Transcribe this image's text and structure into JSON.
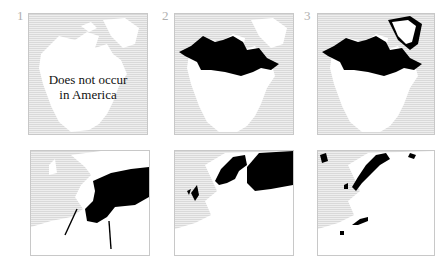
{
  "figure": {
    "panels": [
      {
        "number": "1",
        "region": "North America",
        "range_shown": "none",
        "note_line1": "Does not occur",
        "note_line2": "in America"
      },
      {
        "number": "2",
        "region": "North America",
        "range_shown": "northern Canada / Alaska"
      },
      {
        "number": "3",
        "region": "North America",
        "range_shown": "northern Canada / Alaska, Greenland coast"
      },
      {
        "number": "",
        "region": "Europe",
        "range_shown": "eastern Europe / Russia"
      },
      {
        "number": "",
        "region": "Europe",
        "range_shown": "Scandinavia, British Isles, northern Russia"
      },
      {
        "number": "",
        "region": "Europe",
        "range_shown": "Scandinavian mountains, Alps, Pyrenees, Iceland"
      }
    ],
    "colors": {
      "range": "#000000",
      "land": "#ffffff",
      "sea": "#e3e3e3",
      "frame": "#c8c8c8",
      "number": "#b0b0b0"
    }
  }
}
